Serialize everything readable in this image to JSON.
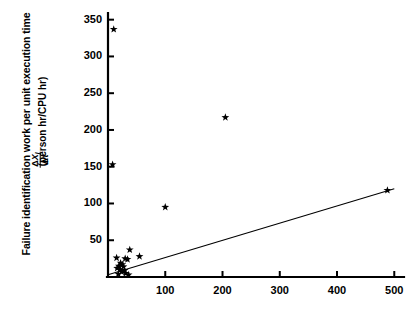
{
  "figure": {
    "background": "#ffffff",
    "ink": "#000000"
  },
  "axis_titles": {
    "y_outer": "Failure identification work per unit execution time",
    "y_units": "(person hr/CPU hr)",
    "y_fraction_numerator_delta": "Δ",
    "y_fraction_numerator_symbol": "X",
    "y_fraction_numerator_subscript": "I",
    "y_fraction_denominator_delta": "Δ",
    "y_fraction_denominator_symbol": "τ"
  },
  "chart_data": {
    "type": "scatter",
    "title": "",
    "xlabel": "",
    "ylabel": "Failure identification work per unit execution time  ΔX_I/Δτ  (person hr/CPU hr)",
    "xlim": [
      0,
      510
    ],
    "ylim": [
      0,
      355
    ],
    "xticks": [
      100,
      200,
      300,
      400,
      500
    ],
    "yticks": [
      50,
      100,
      150,
      200,
      250,
      300,
      350
    ],
    "grid": false,
    "legend": null,
    "marker": "star",
    "marker_color": "#000000",
    "points": [
      {
        "x": 10,
        "y": 337
      },
      {
        "x": 8,
        "y": 153
      },
      {
        "x": 100,
        "y": 95
      },
      {
        "x": 205,
        "y": 217
      },
      {
        "x": 488,
        "y": 118
      },
      {
        "x": 38,
        "y": 37
      },
      {
        "x": 55,
        "y": 28
      },
      {
        "x": 15,
        "y": 26
      },
      {
        "x": 30,
        "y": 25
      },
      {
        "x": 34,
        "y": 24
      },
      {
        "x": 22,
        "y": 19
      },
      {
        "x": 25,
        "y": 17
      },
      {
        "x": 19,
        "y": 15
      },
      {
        "x": 27,
        "y": 14
      },
      {
        "x": 16,
        "y": 12
      },
      {
        "x": 21,
        "y": 10
      },
      {
        "x": 29,
        "y": 9
      },
      {
        "x": 24,
        "y": 7
      },
      {
        "x": 31,
        "y": 5
      },
      {
        "x": 18,
        "y": 4
      },
      {
        "x": 36,
        "y": 3
      }
    ],
    "fit_line": {
      "type": "line",
      "x0": 0,
      "y0": 3,
      "x1": 500,
      "y1": 120,
      "color": "#000000"
    }
  }
}
